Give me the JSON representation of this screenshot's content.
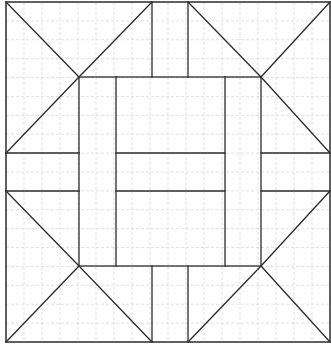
{
  "diagram": {
    "type": "quilt-block-pattern",
    "colors": {
      "background": "#ffffff",
      "line": "#2b2b2b",
      "grid": "#d9d9d9"
    },
    "bounds": {
      "x0": 6,
      "y0": 2,
      "x1": 330,
      "y1": 342
    },
    "grid": {
      "cols": 18,
      "rows": 18
    },
    "outer_border": {
      "x": 6,
      "y": 2,
      "w": 324,
      "h": 340
    },
    "inner_square": {
      "x": 79,
      "y": 77,
      "w": 182,
      "h": 189
    },
    "seams": [
      {
        "name": "tl-diag-1",
        "x1": 6,
        "y1": 2,
        "x2": 79,
        "y2": 77
      },
      {
        "name": "tl-diag-2",
        "x1": 79,
        "y1": 77,
        "x2": 152,
        "y2": 2
      },
      {
        "name": "tl-diag-3",
        "x1": 79,
        "y1": 77,
        "x2": 6,
        "y2": 153
      },
      {
        "name": "tr-diag-1",
        "x1": 188,
        "y1": 2,
        "x2": 261,
        "y2": 77
      },
      {
        "name": "tr-diag-2",
        "x1": 261,
        "y1": 77,
        "x2": 330,
        "y2": 2
      },
      {
        "name": "tr-diag-3",
        "x1": 261,
        "y1": 77,
        "x2": 330,
        "y2": 153
      },
      {
        "name": "bl-diag-1",
        "x1": 6,
        "y1": 191,
        "x2": 79,
        "y2": 266
      },
      {
        "name": "bl-diag-2",
        "x1": 79,
        "y1": 266,
        "x2": 6,
        "y2": 342
      },
      {
        "name": "bl-diag-3",
        "x1": 79,
        "y1": 266,
        "x2": 152,
        "y2": 342
      },
      {
        "name": "br-diag-1",
        "x1": 330,
        "y1": 191,
        "x2": 261,
        "y2": 266
      },
      {
        "name": "br-diag-2",
        "x1": 261,
        "y1": 266,
        "x2": 330,
        "y2": 342
      },
      {
        "name": "br-diag-3",
        "x1": 261,
        "y1": 266,
        "x2": 188,
        "y2": 342
      },
      {
        "name": "top-bar-left",
        "x1": 152,
        "y1": 2,
        "x2": 152,
        "y2": 77
      },
      {
        "name": "top-bar-right",
        "x1": 188,
        "y1": 2,
        "x2": 188,
        "y2": 77
      },
      {
        "name": "bottom-bar-left",
        "x1": 152,
        "y1": 266,
        "x2": 152,
        "y2": 342
      },
      {
        "name": "bottom-bar-right",
        "x1": 188,
        "y1": 266,
        "x2": 188,
        "y2": 342
      },
      {
        "name": "left-bar-top",
        "x1": 6,
        "y1": 153,
        "x2": 79,
        "y2": 153
      },
      {
        "name": "left-bar-bottom",
        "x1": 6,
        "y1": 191,
        "x2": 79,
        "y2": 191
      },
      {
        "name": "right-bar-top",
        "x1": 261,
        "y1": 153,
        "x2": 330,
        "y2": 153
      },
      {
        "name": "right-bar-bottom",
        "x1": 261,
        "y1": 191,
        "x2": 330,
        "y2": 191
      },
      {
        "name": "inner-vert-left",
        "x1": 116,
        "y1": 77,
        "x2": 116,
        "y2": 266
      },
      {
        "name": "inner-vert-right",
        "x1": 225,
        "y1": 77,
        "x2": 225,
        "y2": 266
      },
      {
        "name": "center-horiz-top",
        "x1": 116,
        "y1": 153,
        "x2": 225,
        "y2": 153
      },
      {
        "name": "center-horiz-bottom",
        "x1": 116,
        "y1": 191,
        "x2": 225,
        "y2": 191
      }
    ]
  }
}
